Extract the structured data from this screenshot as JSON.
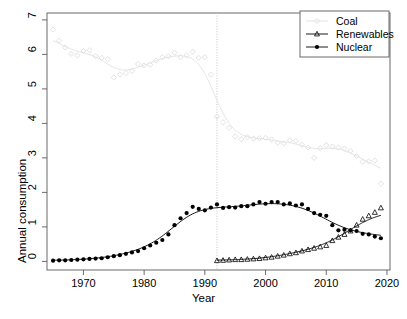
{
  "chart_data": {
    "type": "line",
    "title": "",
    "xlabel": "Year",
    "ylabel": "Annual consumption",
    "xlim": [
      1964,
      2020.5
    ],
    "ylim": [
      -0.25,
      7.2
    ],
    "xticks": [
      1970,
      1980,
      1990,
      2000,
      2010,
      2020
    ],
    "xticklabels": [
      "1970",
      "1980",
      "1990",
      "2000",
      "2010",
      "2020"
    ],
    "yticks": [
      0,
      1,
      2,
      3,
      4,
      5,
      6,
      7
    ],
    "yticklabels": [
      "0",
      "1",
      "2",
      "3",
      "4",
      "5",
      "6",
      "7"
    ],
    "grid": false,
    "legend_position": "top-right",
    "annotations": [
      {
        "name": "vertical-reference-line",
        "type": "vline",
        "x": 1992,
        "style": "dotted",
        "color": "#bdbdbd"
      }
    ],
    "series": [
      {
        "name": "Coal",
        "marker": "open-diamond",
        "color": "#e2e2e2",
        "line": "loess-smooth",
        "x": [
          1965,
          1966,
          1967,
          1968,
          1969,
          1970,
          1971,
          1972,
          1973,
          1974,
          1975,
          1976,
          1977,
          1978,
          1979,
          1980,
          1981,
          1982,
          1983,
          1984,
          1985,
          1986,
          1987,
          1988,
          1989,
          1990,
          1991,
          1992,
          1993,
          1994,
          1995,
          1996,
          1997,
          1998,
          1999,
          2000,
          2001,
          2002,
          2003,
          2004,
          2005,
          2006,
          2007,
          2008,
          2009,
          2010,
          2011,
          2012,
          2013,
          2014,
          2015,
          2016,
          2017,
          2018,
          2019
        ],
        "y": [
          6.72,
          6.4,
          6.2,
          6.02,
          5.97,
          6.1,
          6.12,
          5.95,
          5.9,
          5.86,
          5.33,
          5.42,
          5.46,
          5.52,
          5.72,
          5.68,
          5.7,
          5.82,
          5.92,
          5.95,
          6.05,
          5.92,
          5.97,
          6.08,
          5.9,
          5.92,
          5.41,
          4.2,
          4.03,
          3.87,
          3.62,
          3.54,
          3.6,
          3.56,
          3.57,
          3.58,
          3.53,
          3.44,
          3.42,
          3.51,
          3.49,
          3.38,
          3.3,
          3.0,
          3.28,
          3.37,
          3.33,
          3.3,
          3.27,
          3.2,
          3.05,
          2.89,
          2.9,
          2.92,
          2.25
        ]
      },
      {
        "name": "Renewables",
        "marker": "open-triangle",
        "color": "#000000",
        "line": "loess-smooth",
        "x": [
          1992,
          1993,
          1994,
          1995,
          1996,
          1997,
          1998,
          1999,
          2000,
          2001,
          2002,
          2003,
          2004,
          2005,
          2006,
          2007,
          2008,
          2009,
          2010,
          2011,
          2012,
          2013,
          2014,
          2015,
          2016,
          2017,
          2018,
          2019
        ],
        "y": [
          0.02,
          0.03,
          0.04,
          0.05,
          0.05,
          0.06,
          0.07,
          0.08,
          0.1,
          0.12,
          0.15,
          0.18,
          0.22,
          0.25,
          0.3,
          0.34,
          0.38,
          0.42,
          0.46,
          0.6,
          0.7,
          0.78,
          0.88,
          1.05,
          1.22,
          1.32,
          1.42,
          1.55
        ]
      },
      {
        "name": "Nuclear",
        "marker": "filled-circle",
        "color": "#000000",
        "line": "loess-smooth",
        "x": [
          1965,
          1966,
          1967,
          1968,
          1969,
          1970,
          1971,
          1972,
          1973,
          1974,
          1975,
          1976,
          1977,
          1978,
          1979,
          1980,
          1981,
          1982,
          1983,
          1984,
          1985,
          1986,
          1987,
          1988,
          1989,
          1990,
          1991,
          1992,
          1993,
          1994,
          1995,
          1996,
          1997,
          1998,
          1999,
          2000,
          2001,
          2002,
          2003,
          2004,
          2005,
          2006,
          2007,
          2008,
          2009,
          2010,
          2011,
          2012,
          2013,
          2014,
          2015,
          2016,
          2017,
          2018,
          2019
        ],
        "y": [
          0.02,
          0.03,
          0.03,
          0.04,
          0.05,
          0.06,
          0.07,
          0.08,
          0.09,
          0.12,
          0.15,
          0.18,
          0.22,
          0.26,
          0.3,
          0.38,
          0.46,
          0.54,
          0.62,
          0.78,
          1.05,
          1.25,
          1.4,
          1.58,
          1.52,
          1.48,
          1.56,
          1.65,
          1.55,
          1.57,
          1.56,
          1.6,
          1.6,
          1.65,
          1.72,
          1.67,
          1.72,
          1.72,
          1.65,
          1.68,
          1.62,
          1.65,
          1.52,
          1.4,
          1.35,
          1.32,
          1.05,
          0.9,
          0.92,
          0.9,
          0.88,
          0.8,
          0.78,
          0.72,
          0.67
        ]
      }
    ]
  },
  "legend": {
    "items": [
      {
        "label": "Coal"
      },
      {
        "label": "Renewables"
      },
      {
        "label": "Nuclear"
      }
    ]
  }
}
